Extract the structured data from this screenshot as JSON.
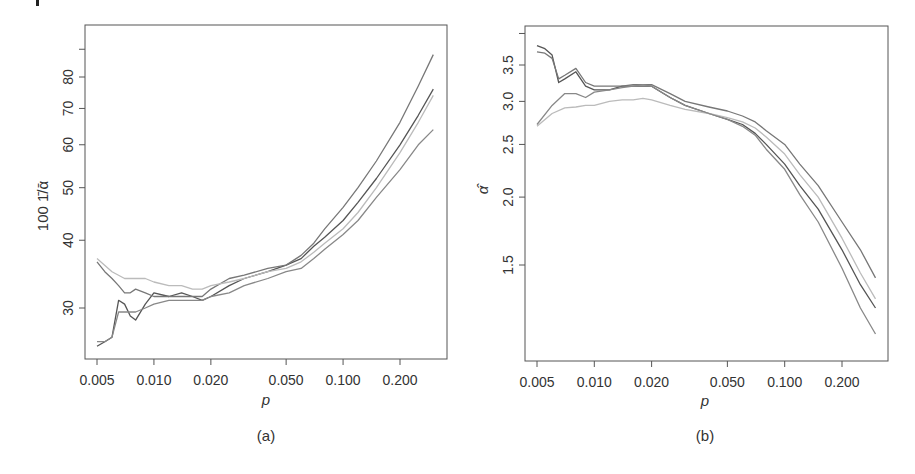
{
  "chart_data": [
    {
      "panel": "a",
      "type": "line",
      "caption": "(a)",
      "title": "",
      "xlabel": "p",
      "ylabel": "1001/ᾱ",
      "ylabel_display": "100 1̄/ᾱ",
      "xscale": "log",
      "yscale": "log",
      "xticks": [
        0.005,
        0.01,
        0.02,
        0.05,
        0.1,
        0.2
      ],
      "xtick_labels": [
        "0.005",
        "0.010",
        "0.020",
        "0.050",
        "0.100",
        "0.200"
      ],
      "yticks": [
        30,
        40,
        50,
        60,
        70,
        80,
        90
      ],
      "ytick_labels": [
        "30",
        "40",
        "50",
        "60",
        "70",
        "80",
        ""
      ],
      "xlim": [
        0.0045,
        0.36
      ],
      "ylim": [
        25,
        100
      ],
      "grid": false,
      "legend": null,
      "series": [
        {
          "name": "series-1 (dark)",
          "color": "#555555",
          "x": [
            0.005,
            0.0055,
            0.006,
            0.0065,
            0.007,
            0.0075,
            0.008,
            0.009,
            0.01,
            0.012,
            0.014,
            0.016,
            0.018,
            0.02,
            0.025,
            0.03,
            0.04,
            0.05,
            0.06,
            0.07,
            0.08,
            0.1,
            0.12,
            0.15,
            0.2,
            0.25,
            0.3
          ],
          "y": [
            25.5,
            26.0,
            26.5,
            31.0,
            30.5,
            29.0,
            28.5,
            30.5,
            32.0,
            31.5,
            32.0,
            31.5,
            31.0,
            31.5,
            33.0,
            34.0,
            35.0,
            36.0,
            37.0,
            39.0,
            40.5,
            43.5,
            47.0,
            52.0,
            60.0,
            68.0,
            76.0
          ]
        },
        {
          "name": "series-2 (medium, upper)",
          "color": "#777777",
          "x": [
            0.005,
            0.0055,
            0.006,
            0.0065,
            0.007,
            0.0075,
            0.008,
            0.009,
            0.01,
            0.012,
            0.014,
            0.016,
            0.018,
            0.02,
            0.025,
            0.03,
            0.04,
            0.05,
            0.06,
            0.07,
            0.08,
            0.1,
            0.12,
            0.15,
            0.2,
            0.25,
            0.3
          ],
          "y": [
            36.5,
            35.0,
            34.0,
            33.0,
            32.0,
            32.0,
            32.5,
            32.0,
            31.5,
            31.5,
            31.5,
            31.5,
            31.5,
            32.5,
            34.0,
            34.5,
            35.5,
            36.0,
            37.5,
            39.5,
            42.0,
            46.0,
            50.0,
            56.0,
            66.0,
            77.0,
            88.0
          ]
        },
        {
          "name": "series-3 (light)",
          "color": "#bbbbbb",
          "x": [
            0.005,
            0.006,
            0.007,
            0.008,
            0.009,
            0.01,
            0.012,
            0.014,
            0.016,
            0.018,
            0.02,
            0.025,
            0.03,
            0.04,
            0.05,
            0.06,
            0.07,
            0.08,
            0.1,
            0.12,
            0.15,
            0.2,
            0.25,
            0.3
          ],
          "y": [
            37.0,
            35.0,
            34.0,
            34.0,
            34.0,
            33.5,
            33.0,
            33.0,
            32.5,
            32.5,
            33.0,
            33.5,
            34.0,
            35.0,
            35.5,
            36.5,
            38.0,
            39.5,
            42.0,
            45.0,
            50.0,
            58.0,
            66.0,
            74.0
          ]
        },
        {
          "name": "series-4 (medium, lower)",
          "color": "#888888",
          "x": [
            0.005,
            0.0055,
            0.006,
            0.0065,
            0.007,
            0.008,
            0.009,
            0.01,
            0.012,
            0.014,
            0.016,
            0.018,
            0.02,
            0.025,
            0.03,
            0.04,
            0.05,
            0.06,
            0.07,
            0.08,
            0.1,
            0.12,
            0.15,
            0.2,
            0.25,
            0.3
          ],
          "y": [
            26.0,
            26.0,
            26.5,
            29.5,
            29.5,
            29.5,
            30.0,
            30.5,
            31.0,
            31.0,
            31.0,
            31.0,
            31.5,
            32.0,
            33.0,
            34.0,
            35.0,
            35.5,
            37.0,
            38.5,
            41.0,
            43.5,
            48.0,
            54.0,
            60.0,
            64.0
          ]
        }
      ]
    },
    {
      "panel": "b",
      "type": "line",
      "caption": "(b)",
      "title": "",
      "xlabel": "p",
      "ylabel": "α̂",
      "xscale": "log",
      "yscale": "log",
      "xticks": [
        0.005,
        0.01,
        0.02,
        0.05,
        0.1,
        0.2
      ],
      "xtick_labels": [
        "0.005",
        "0.010",
        "0.020",
        "0.050",
        "0.100",
        "0.200"
      ],
      "yticks": [
        1.5,
        2.0,
        2.5,
        3.0,
        3.5,
        4.0
      ],
      "ytick_labels": [
        "1.5",
        "2.0",
        "2.5",
        "3.0",
        "3.5",
        ""
      ],
      "xlim": [
        0.0045,
        0.36
      ],
      "ylim": [
        1.12,
        4.2
      ],
      "grid": false,
      "legend": null,
      "series": [
        {
          "name": "series-1 (dark)",
          "color": "#555555",
          "x": [
            0.005,
            0.0055,
            0.006,
            0.0065,
            0.007,
            0.008,
            0.009,
            0.01,
            0.012,
            0.014,
            0.016,
            0.018,
            0.02,
            0.025,
            0.03,
            0.04,
            0.05,
            0.06,
            0.07,
            0.08,
            0.1,
            0.12,
            0.15,
            0.2,
            0.25,
            0.3
          ],
          "y": [
            3.8,
            3.75,
            3.65,
            3.25,
            3.3,
            3.4,
            3.2,
            3.15,
            3.15,
            3.2,
            3.2,
            3.2,
            3.2,
            3.05,
            2.95,
            2.85,
            2.78,
            2.72,
            2.62,
            2.5,
            2.3,
            2.1,
            1.9,
            1.6,
            1.38,
            1.25
          ]
        },
        {
          "name": "series-2 (medium, upper)",
          "color": "#777777",
          "x": [
            0.005,
            0.0055,
            0.006,
            0.0065,
            0.007,
            0.008,
            0.009,
            0.01,
            0.012,
            0.014,
            0.016,
            0.018,
            0.02,
            0.025,
            0.03,
            0.04,
            0.05,
            0.06,
            0.07,
            0.08,
            0.1,
            0.12,
            0.15,
            0.2,
            0.25,
            0.3
          ],
          "y": [
            3.7,
            3.68,
            3.6,
            3.3,
            3.35,
            3.45,
            3.25,
            3.2,
            3.2,
            3.2,
            3.22,
            3.22,
            3.22,
            3.1,
            3.0,
            2.93,
            2.88,
            2.82,
            2.75,
            2.65,
            2.5,
            2.3,
            2.1,
            1.8,
            1.6,
            1.42
          ]
        },
        {
          "name": "series-3 (light)",
          "color": "#bbbbbb",
          "x": [
            0.005,
            0.006,
            0.007,
            0.008,
            0.009,
            0.01,
            0.012,
            0.014,
            0.016,
            0.018,
            0.02,
            0.025,
            0.03,
            0.04,
            0.05,
            0.06,
            0.07,
            0.08,
            0.1,
            0.12,
            0.15,
            0.2,
            0.25,
            0.3
          ],
          "y": [
            2.7,
            2.85,
            2.92,
            2.93,
            2.95,
            2.95,
            3.0,
            3.02,
            3.02,
            3.04,
            3.02,
            2.95,
            2.9,
            2.85,
            2.8,
            2.75,
            2.68,
            2.58,
            2.4,
            2.2,
            2.0,
            1.68,
            1.45,
            1.3
          ]
        },
        {
          "name": "series-4 (medium, lower)",
          "color": "#888888",
          "x": [
            0.005,
            0.006,
            0.007,
            0.008,
            0.009,
            0.01,
            0.012,
            0.014,
            0.016,
            0.018,
            0.02,
            0.025,
            0.03,
            0.04,
            0.05,
            0.06,
            0.07,
            0.08,
            0.1,
            0.12,
            0.15,
            0.2,
            0.25,
            0.3
          ],
          "y": [
            2.72,
            2.95,
            3.1,
            3.1,
            3.05,
            3.12,
            3.15,
            3.18,
            3.2,
            3.22,
            3.2,
            3.05,
            2.95,
            2.85,
            2.78,
            2.7,
            2.6,
            2.45,
            2.25,
            2.02,
            1.8,
            1.48,
            1.25,
            1.12
          ]
        }
      ]
    }
  ],
  "figure": {
    "captions": [
      "(a)",
      "(b)"
    ]
  }
}
